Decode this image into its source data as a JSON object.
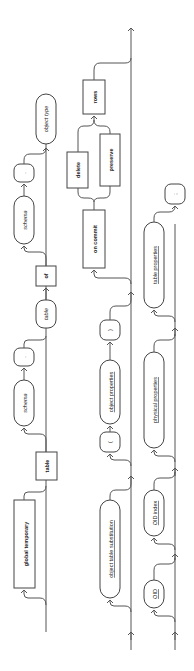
{
  "diagram": {
    "orientation": "rotated-90-ccw",
    "rows": [
      {
        "id": "row1",
        "items": [
          {
            "label": "global temporary",
            "kind": "keyword",
            "optional": true
          },
          {
            "label": "table",
            "kind": "keyword"
          },
          {
            "label": "schema",
            "kind": "nonterminal",
            "optional": true
          },
          {
            "label": ".",
            "kind": "symbol"
          },
          {
            "label": "table",
            "kind": "nonterminal"
          },
          {
            "label": "of",
            "kind": "keyword"
          },
          {
            "label": "schema",
            "kind": "nonterminal",
            "optional": true
          },
          {
            "label": ".",
            "kind": "symbol"
          },
          {
            "label": "object type",
            "kind": "nonterminal"
          }
        ]
      },
      {
        "id": "row2",
        "items": [
          {
            "label": "object table substitution",
            "kind": "reference",
            "optional": true
          },
          {
            "label": "(",
            "kind": "symbol"
          },
          {
            "label": "object properties",
            "kind": "reference"
          },
          {
            "label": ")",
            "kind": "symbol"
          },
          {
            "label": "on commit",
            "kind": "keyword"
          },
          {
            "label": "delete",
            "kind": "keyword"
          },
          {
            "label": "preserve",
            "kind": "keyword"
          },
          {
            "label": "rows",
            "kind": "keyword"
          }
        ]
      },
      {
        "id": "row3",
        "items": [
          {
            "label": "OID",
            "kind": "reference",
            "optional": true
          },
          {
            "label": "OID index",
            "kind": "reference",
            "optional": true
          },
          {
            "label": "physical properties",
            "kind": "reference",
            "optional": true
          },
          {
            "label": "table properties",
            "kind": "reference",
            "optional": true
          },
          {
            "label": ";",
            "kind": "symbol"
          }
        ]
      }
    ]
  }
}
